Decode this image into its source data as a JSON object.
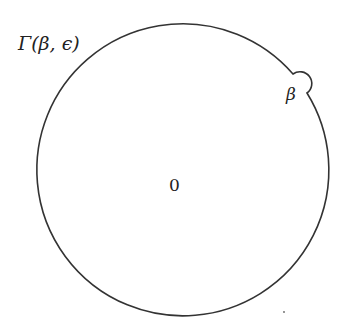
{
  "diagram": {
    "contour_label": "Γ(β, ϵ)",
    "point_label": "β",
    "center_label": "0",
    "stroke_color": "#333333",
    "background": "#ffffff"
  }
}
